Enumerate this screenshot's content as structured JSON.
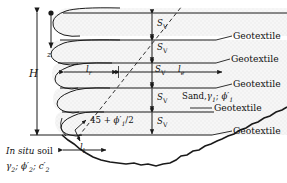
{
  "figure": {
    "type": "engineering-diagram"
  },
  "labels": {
    "height_symbol": "H",
    "depth_symbol": "z",
    "spacing_symbol_base": "S",
    "spacing_symbol_sub": "V",
    "length_resist_base": "l",
    "length_resist_sub": "r",
    "length_effective_base": "l",
    "length_effective_sub": "e",
    "lap_length_base": "l",
    "lap_length_sub": "l",
    "angle_text_prefix": "45 + ",
    "angle_phi": "ϕ",
    "angle_phi_sub": "1",
    "angle_text_suffix": "/2",
    "geotextile": "Geotextile",
    "sand_prefix": "Sand,",
    "sand_gamma": "γ",
    "sand_gamma_sub": "1",
    "sand_sep": "; ",
    "sand_phi": "ϕ",
    "sand_phi_sub": "1",
    "insitu_italic": "In situ",
    "insitu_rest": " soil",
    "soil_gamma": "γ",
    "soil_gamma_sub": "2",
    "soil_phi": "ϕ",
    "soil_phi_sub": "2",
    "soil_c": "c",
    "soil_c_sub": "2",
    "soil_sep": "; "
  },
  "geotextile_labels": [
    {
      "text": "Geotextile",
      "y": 36
    },
    {
      "text": "Geotextile",
      "y": 59
    },
    {
      "text": "Geotextile",
      "y": 84
    },
    {
      "text": "Geotextile",
      "y": 108
    },
    {
      "text": "Geotextile",
      "y": 131
    }
  ],
  "sv_labels": [
    {
      "y": 22
    },
    {
      "y": 46
    },
    {
      "y": 68
    },
    {
      "y": 96
    },
    {
      "y": 120
    }
  ],
  "colors": {
    "line": "#1a1a1a",
    "fill": "#f2f2f2",
    "stipple": "#d8d8d8",
    "background": "#ffffff",
    "text": "#111111"
  },
  "geometry": {
    "layer_y": [
      13,
      40,
      63,
      88,
      112,
      135
    ],
    "wall_face_x": 62,
    "centerline_x": 152,
    "right_edge_x": 287,
    "base_y": 135,
    "top_y": 8
  }
}
